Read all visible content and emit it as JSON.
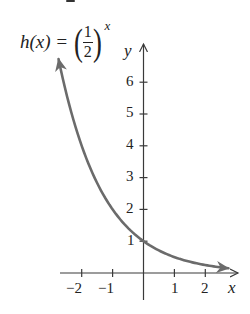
{
  "chart_data": {
    "type": "line",
    "function": {
      "name": "h",
      "variable": "x",
      "base_numerator": "1",
      "base_denominator": "2",
      "exponent": "x"
    },
    "xlabel": "x",
    "ylabel": "y",
    "x_ticks": [
      -2,
      -1,
      1,
      2
    ],
    "y_ticks": [
      1,
      2,
      3,
      4,
      5,
      6
    ],
    "xlim": [
      -2.8,
      3.0
    ],
    "ylim": [
      -0.9,
      7.2
    ],
    "grid": false,
    "legend": "none",
    "series": [
      {
        "name": "h(x) = (1/2)^x",
        "color": "#6b6b6b",
        "x": [
          -2.75,
          -2.5,
          -2,
          -1.5,
          -1,
          -0.5,
          0,
          0.5,
          1,
          1.5,
          2,
          2.5,
          2.75
        ],
        "y": [
          6.73,
          5.66,
          4.0,
          2.83,
          2.0,
          1.41,
          1.0,
          0.71,
          0.5,
          0.35,
          0.25,
          0.18,
          0.15
        ],
        "arrows": "both-ends"
      }
    ],
    "key_point": {
      "x": 0,
      "y": 1
    }
  },
  "labels": {
    "formula_lhs": "h(x) =",
    "formula_paren_open": "(",
    "formula_paren_close": ")",
    "formula_num": "1",
    "formula_den": "2",
    "formula_exp": "x",
    "x_axis": "x",
    "y_axis": "y",
    "x_tick_labels": [
      "−2",
      "−1",
      "1",
      "2"
    ],
    "y_tick_labels": [
      "6",
      "5",
      "4",
      "3",
      "2",
      "1"
    ]
  },
  "colors": {
    "axis": "#3a3a3a",
    "curve": "#6b6b6b",
    "text": "#222222",
    "background": "#ffffff"
  }
}
